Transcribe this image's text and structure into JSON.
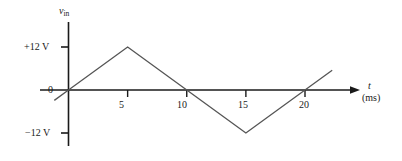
{
  "chart_data": {
    "type": "line",
    "title": "",
    "subtitle": "",
    "xlabel": "t",
    "xunit": "(ms)",
    "ylabel": "v",
    "ylabel_sub": "in",
    "xlim": [
      -1.2,
      22.5
    ],
    "ylim": [
      -16,
      16
    ],
    "grid": false,
    "legend": null,
    "x_ticks": [
      {
        "value": 5,
        "label": "5"
      },
      {
        "value": 10,
        "label": "10"
      },
      {
        "value": 15,
        "label": "15"
      },
      {
        "value": 20,
        "label": "20"
      }
    ],
    "y_ticks": [
      {
        "value": 12,
        "label": "+12 V"
      },
      {
        "value": 0,
        "label": "0"
      },
      {
        "value": -12,
        "label": "−12 V"
      }
    ],
    "series": [
      {
        "name": "v_in triangular wave",
        "x": [
          -1.2,
          0,
          5,
          10,
          15,
          20,
          22.3
        ],
        "y": [
          -2.9,
          0,
          12,
          0,
          -12,
          0,
          5.5
        ]
      }
    ],
    "annotations": {
      "waveform_description": "Triangular wave, peak +12 V at 5 ms, zero at 10 ms, trough −12 V at 15 ms, zero at 20 ms, period 20 ms"
    }
  },
  "axes": {
    "y_axis_name": "v",
    "y_axis_subscript": "in",
    "x_axis_name": "t",
    "x_axis_unit": "(ms)",
    "zero_label": "0",
    "pos_peak_label": "+12 V",
    "neg_peak_label": "−12 V",
    "tick_5": "5",
    "tick_10": "10",
    "tick_15": "15",
    "tick_20": "20"
  },
  "colors": {
    "axis": "#1a1a1a",
    "waveform": "#4a4a4a",
    "background": "#ffffff",
    "text": "#1a1a1a"
  }
}
